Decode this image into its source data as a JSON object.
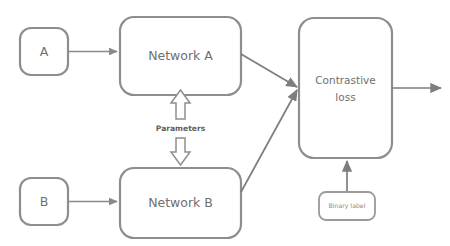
{
  "diagram": {
    "background_color": "#ffffff",
    "stroke_color": "#8e8e8e",
    "text_color": "#6f6f6f",
    "nodes": [
      {
        "id": "input_a",
        "label": "A",
        "shape": "rounded-rect"
      },
      {
        "id": "network_a",
        "label": "Network A",
        "shape": "rounded-rect"
      },
      {
        "id": "input_b",
        "label": "B",
        "shape": "rounded-rect"
      },
      {
        "id": "network_b",
        "label": "Network B",
        "shape": "rounded-rect"
      },
      {
        "id": "loss",
        "label_line1": "Contrastive",
        "label_line2": "loss",
        "shape": "rounded-rect"
      },
      {
        "id": "binary_label",
        "label": "Binary label",
        "shape": "rounded-rect"
      }
    ],
    "edges": [
      {
        "id": "a_to_network_a",
        "from": "input_a",
        "to": "network_a",
        "style": "arrow"
      },
      {
        "id": "b_to_network_b",
        "from": "input_b",
        "to": "network_b",
        "style": "arrow"
      },
      {
        "id": "network_a_to_loss",
        "from": "network_a",
        "to": "loss",
        "style": "arrow"
      },
      {
        "id": "network_b_to_loss",
        "from": "network_b",
        "to": "loss",
        "style": "arrow"
      },
      {
        "id": "binary_label_to_loss",
        "from": "binary_label",
        "to": "loss",
        "style": "arrow"
      },
      {
        "id": "loss_output",
        "from": "loss",
        "to": "output",
        "style": "arrow"
      },
      {
        "id": "parameters_up",
        "from": "parameters",
        "to": "network_a",
        "style": "block-arrow"
      },
      {
        "id": "parameters_down",
        "from": "parameters",
        "to": "network_b",
        "style": "block-arrow"
      }
    ],
    "edge_labels": {
      "parameters": "Parameters"
    }
  }
}
